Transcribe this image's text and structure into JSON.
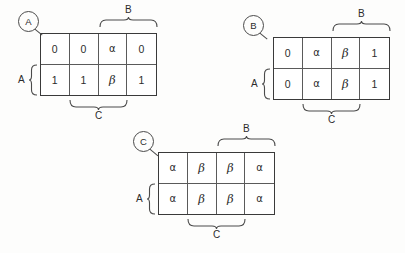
{
  "figure": {
    "background_color": "#fdfdfc",
    "line_color": "#3a3a3a"
  },
  "panels": [
    {
      "callout": "A",
      "top_brace_label": "B",
      "left_brace_label": "A",
      "bottom_brace_label": "C",
      "rows": [
        [
          "0",
          "0",
          "α",
          "0"
        ],
        [
          "1",
          "1",
          "β",
          "1"
        ]
      ]
    },
    {
      "callout": "B",
      "top_brace_label": "B",
      "left_brace_label": "A",
      "bottom_brace_label": "C",
      "rows": [
        [
          "0",
          "α",
          "β",
          "1"
        ],
        [
          "0",
          "α",
          "β",
          "1"
        ]
      ]
    },
    {
      "callout": "C",
      "top_brace_label": "B",
      "left_brace_label": "A",
      "bottom_brace_label": "C",
      "rows": [
        [
          "α",
          "β",
          "β",
          "α"
        ],
        [
          "α",
          "β",
          "β",
          "α"
        ]
      ]
    }
  ]
}
